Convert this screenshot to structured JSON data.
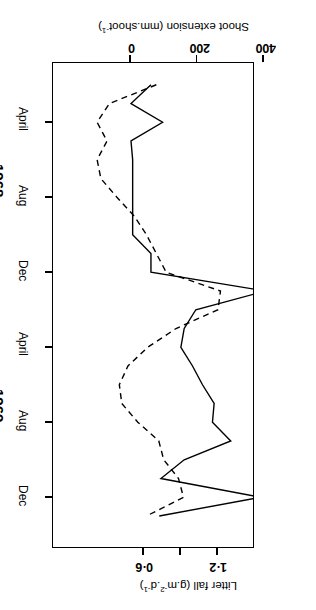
{
  "figure": {
    "orientation": "rotated-180",
    "background": "#ffffff",
    "ink": "#000000"
  },
  "chart_data": {
    "type": "line",
    "title": "",
    "subtitle": "",
    "orientation": "horizontal-time-axis-rotated",
    "grid": false,
    "legend": null,
    "xlabel": "",
    "ylabel": "Shoot extension (mm.shoot⁻¹)",
    "y2label": "Litter fall (g.m⁻².d⁻¹)",
    "x_tick_labels": [
      "April",
      "Aug",
      "Dec",
      "April",
      "Aug",
      "Dec"
    ],
    "x_year_labels": [
      "1968",
      "1969"
    ],
    "xlim": [
      "1968-02",
      "1970-02"
    ],
    "ylim": [
      -40,
      470
    ],
    "y_ticks": [
      0,
      200,
      400
    ],
    "y_tick_labels": [
      "0",
      "200",
      "400"
    ],
    "y2lim": [
      0.0,
      1.55
    ],
    "y2_ticks": [
      0.6,
      1.2
    ],
    "y2_tick_labels": [
      "0·6",
      "1·2"
    ],
    "series": [
      {
        "name": "Shoot extension",
        "style": "solid",
        "axis": "left",
        "units": "mm.shoot⁻¹",
        "x": [
          "1968-02",
          "1968-03",
          "1968-04",
          "1968-05",
          "1968-06",
          "1968-08",
          "1968-10",
          "1968-11",
          "1968-12",
          "1969-01",
          "1969-02",
          "1969-03",
          "1969-04",
          "1969-05",
          "1969-06",
          "1969-07",
          "1969-08",
          "1969-09",
          "1969-10",
          "1969-11",
          "1969-12",
          "1970-01"
        ],
        "values": [
          60,
          0,
          95,
          0,
          5,
          5,
          5,
          60,
          60,
          405,
          195,
          160,
          150,
          185,
          215,
          250,
          245,
          300,
          160,
          90,
          390,
          85
        ]
      },
      {
        "name": "Litter fall",
        "style": "dashed",
        "axis": "right",
        "units": "g.m⁻².d⁻¹",
        "x": [
          "1968-02",
          "1968-03",
          "1968-04",
          "1968-05",
          "1968-06",
          "1968-07",
          "1968-08",
          "1968-09",
          "1968-10",
          "1968-11",
          "1968-12",
          "1969-01",
          "1969-02",
          "1969-03",
          "1969-04",
          "1969-05",
          "1969-06",
          "1969-07",
          "1969-08",
          "1969-09",
          "1969-10",
          "1969-11",
          "1969-12",
          "1970-01"
        ],
        "values": [
          0.7,
          0.32,
          0.22,
          0.3,
          0.22,
          0.25,
          0.38,
          0.52,
          0.62,
          0.7,
          0.78,
          1.22,
          1.2,
          0.86,
          0.63,
          0.47,
          0.4,
          0.42,
          0.55,
          0.72,
          0.76,
          0.88,
          0.92,
          0.62
        ]
      }
    ]
  },
  "axes": {
    "left_axis": {
      "title": "Shoot extension (mm.shoot",
      "title_sup": "-1",
      "title_tail": ")",
      "ticks": [
        {
          "label": "0"
        },
        {
          "label": "200"
        },
        {
          "label": "400"
        }
      ]
    },
    "right_axis": {
      "title_lead": "Litter fall (g.m",
      "title_sup1": "-2",
      "title_mid": ".d",
      "title_sup2": "-1",
      "title_tail": ")",
      "ticks": [
        {
          "label": "0·6"
        },
        {
          "label": "1·2"
        }
      ]
    },
    "time_axis": {
      "months": [
        {
          "label": "April"
        },
        {
          "label": "Aug"
        },
        {
          "label": "Dec"
        },
        {
          "label": "April"
        },
        {
          "label": "Aug"
        },
        {
          "label": "Dec"
        }
      ],
      "years": [
        {
          "label": "1968"
        },
        {
          "label": "1969"
        }
      ]
    }
  }
}
